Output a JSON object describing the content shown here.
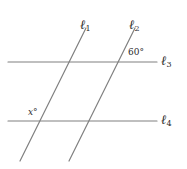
{
  "figure": {
    "type": "geometry-diagram",
    "width": 187,
    "height": 169,
    "background_color": "#ffffff",
    "line_color": "#808080",
    "text_color": "#2b2b2b"
  },
  "labels": {
    "l1": {
      "name": "ℓ",
      "subscript": "1"
    },
    "l2": {
      "name": "ℓ",
      "subscript": "2"
    },
    "l3": {
      "name": "ℓ",
      "subscript": "3"
    },
    "l4": {
      "name": "ℓ",
      "subscript": "4"
    }
  },
  "angles": {
    "known": {
      "value": "60",
      "unit": "°",
      "text": "60°"
    },
    "unknown": {
      "value": "x",
      "unit": "°",
      "text": "x°"
    }
  },
  "geometry": {
    "horizontal_lines": [
      {
        "id": "l3",
        "x1": 8,
        "y1": 62,
        "x2": 157,
        "y2": 62
      },
      {
        "id": "l4",
        "x1": 8,
        "y1": 121,
        "x2": 157,
        "y2": 121
      }
    ],
    "transversals": [
      {
        "id": "l1",
        "x1": 86,
        "y1": 28,
        "x2": 20,
        "y2": 161
      },
      {
        "id": "l2",
        "x1": 135,
        "y1": 28,
        "x2": 69,
        "y2": 161
      }
    ],
    "intersections": [
      {
        "lines": "l1-l3",
        "x": 73,
        "y": 62
      },
      {
        "lines": "l2-l3",
        "x": 122,
        "y": 62
      },
      {
        "lines": "l1-l4",
        "x": 44,
        "y": 121
      },
      {
        "lines": "l2-l4",
        "x": 93,
        "y": 121
      }
    ]
  }
}
